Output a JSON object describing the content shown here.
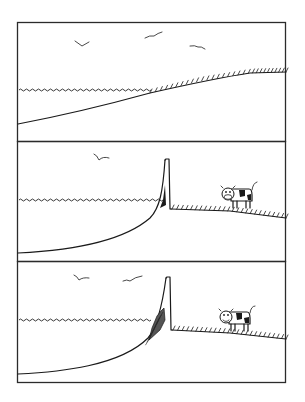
{
  "comic": {
    "panel_count": 3,
    "panels": [
      {
        "id": 1,
        "scene": "sea-meets-gentle-grassy-slope",
        "birds": 3,
        "has_cow": false,
        "has_wall": false
      },
      {
        "id": 2,
        "scene": "tall-seawall-separating-sea-and-field",
        "birds": 1,
        "has_cow": true,
        "has_wall": true
      },
      {
        "id": 3,
        "scene": "seawall-with-sediment-buildup",
        "birds": 2,
        "has_cow": true,
        "has_wall": true
      }
    ],
    "colors": {
      "ink": "#1a1a1a",
      "paper": "#ffffff"
    }
  }
}
